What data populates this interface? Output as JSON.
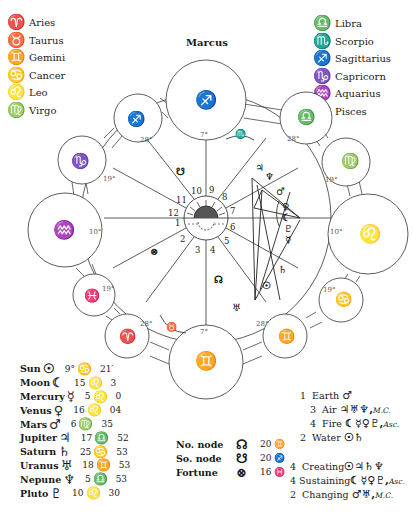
{
  "title": "Marcus",
  "legend_left": [
    {
      "glyph": "♈",
      "label": "Aries"
    },
    {
      "glyph": "♉",
      "label": "Taurus"
    },
    {
      "glyph": "♊",
      "label": "Gemini"
    },
    {
      "glyph": "♋",
      "label": "Cancer"
    },
    {
      "glyph": "♌",
      "label": "Leo"
    },
    {
      "glyph": "♍",
      "label": "Virgo"
    }
  ],
  "legend_right": [
    {
      "glyph": "♎",
      "label": "Libra"
    },
    {
      "glyph": "♏",
      "label": "Scorpio"
    },
    {
      "glyph": "♐",
      "label": "Sagittarius"
    },
    {
      "glyph": "♑",
      "label": "Capricorn"
    },
    {
      "glyph": "♒",
      "label": "Aquarius"
    },
    {
      "glyph": "♓",
      "label": "Pisces"
    }
  ],
  "wheel": {
    "house_numbers": [
      "1",
      "2",
      "3",
      "4",
      "5",
      "6",
      "7",
      "8",
      "9",
      "10",
      "11",
      "12"
    ],
    "cusps": [
      {
        "id": "top",
        "sign": "♐",
        "degree": "7°"
      },
      {
        "id": "libra",
        "sign": "♎",
        "degree": "28°"
      },
      {
        "id": "virgo",
        "sign": "♍",
        "degree": "19°"
      },
      {
        "id": "leo",
        "sign": "♌",
        "degree": "10°"
      },
      {
        "id": "cancer",
        "sign": "♋",
        "degree": "19°"
      },
      {
        "id": "gemini28",
        "sign": "♊",
        "degree": "28°"
      },
      {
        "id": "bottom",
        "sign": "♊",
        "degree": "7°"
      },
      {
        "id": "aries",
        "sign": "♈",
        "degree": "28°"
      },
      {
        "id": "pisces",
        "sign": "♓",
        "degree": "19°"
      },
      {
        "id": "aquarius",
        "sign": "♒",
        "degree": "10°"
      },
      {
        "id": "capricorn",
        "sign": "♑",
        "degree": "19°"
      },
      {
        "id": "sagittarius28",
        "sign": "♐",
        "degree": "28°"
      }
    ],
    "intercepted": {
      "scorpio": "♏",
      "taurus": "♉"
    },
    "planet_glyphs": {
      "south_node": "☋",
      "jupiter": "♃",
      "neptune": "♆",
      "mars": "♂",
      "venus": "♀",
      "moon": "☾",
      "pluto": "♇",
      "mercury": "☿",
      "saturn": "♄",
      "sun": "☉",
      "north_node": "☊",
      "uranus": "♅"
    }
  },
  "planets": [
    {
      "name": "Sun",
      "glyph": "☉",
      "deg": "9°",
      "sign": "♋",
      "min": "21′"
    },
    {
      "name": "Moon",
      "glyph": "☾",
      "deg": "15",
      "sign": "♌",
      "min": "3"
    },
    {
      "name": "Mercury",
      "glyph": "☿",
      "deg": "5",
      "sign": "♌",
      "min": "0"
    },
    {
      "name": "Venus",
      "glyph": "♀",
      "deg": "16",
      "sign": "♌",
      "min": "04"
    },
    {
      "name": "Mars",
      "glyph": "♂",
      "deg": "6",
      "sign": "♍",
      "min": "35"
    },
    {
      "name": "Jupiter",
      "glyph": "♃",
      "deg": "17",
      "sign": "♎",
      "min": "52"
    },
    {
      "name": "Saturn",
      "glyph": "♄",
      "deg": "25",
      "sign": "♋",
      "min": "53"
    },
    {
      "name": "Uranus",
      "glyph": "♅",
      "deg": "18",
      "sign": "♊",
      "min": "53"
    },
    {
      "name": "Nepune",
      "glyph": "♆",
      "deg": "5",
      "sign": "♎",
      "min": "53"
    },
    {
      "name": "Pluto",
      "glyph": "♇",
      "deg": "10",
      "sign": "♌",
      "min": "30"
    }
  ],
  "nodes": [
    {
      "label": "No. node",
      "glyph": "☊",
      "value": "20 ♊"
    },
    {
      "label": "So. node",
      "glyph": "☋",
      "value": "20 ♐"
    },
    {
      "label": "Fortune",
      "glyph": "⊗",
      "value": "16 ♓"
    }
  ],
  "elements": [
    {
      "count": "1",
      "label": "Earth",
      "glyphs": "♂",
      "extra": ""
    },
    {
      "count": "3",
      "label": "Air",
      "glyphs": "♃♅♆,",
      "extra": "M.C."
    },
    {
      "count": "4",
      "label": "Fire",
      "glyphs": "☾☿♀♇,",
      "extra": "Asc."
    },
    {
      "count": "2",
      "label": "Water",
      "glyphs": "☉♄",
      "extra": ""
    }
  ],
  "modes": [
    {
      "count": "4",
      "label": "Creating",
      "glyphs": "☉♃♄♆",
      "extra": ""
    },
    {
      "count": "4",
      "label": "Sustaining",
      "glyphs": "☾☿♀♇,",
      "extra": "Asc."
    },
    {
      "count": "2",
      "label": "Changing",
      "glyphs": "♂♅,",
      "extra": "M.C."
    }
  ]
}
